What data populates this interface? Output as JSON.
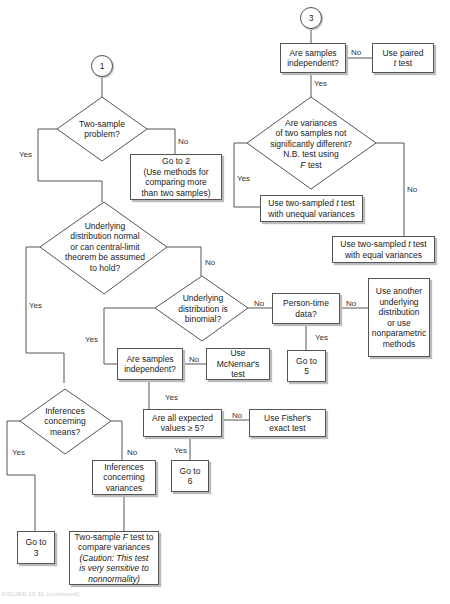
{
  "connectors": {
    "c1": "1",
    "c3": "3"
  },
  "chart1": {
    "two_sample": "Two-sample\nproblem?",
    "goto2": "Go to 2\n(Use methods for\ncomparing more\nthan two samples)",
    "underlying_normal": "Underlying\ndistribution normal\nor can central-limit\ntheorem be assumed\nto hold?",
    "binomial": "Underlying\ndistribution is\nbinomial?",
    "person_time": "Person-time\ndata?",
    "another_dist": "Use another\nunderlying\ndistribution\nor use\nnonparametric\nmethods",
    "goto5": "Go to\n5",
    "samples_indep_b": "Are samples\nindependent?",
    "mcnemar": "Use McNemar's\ntest",
    "expected_values": "Are all expected\nvalues ≥ 5?",
    "fisher": "Use Fisher's\nexact test",
    "goto6": "Go to\n6",
    "inferences_means": "Inferences\nconcerning\nmeans?",
    "inferences_variances": "Inferences\nconcerning\nvariances",
    "goto3": "Go to\n3",
    "f_test_pre": "Two-sample ",
    "f_test_F": "F",
    "f_test_post": " test to\ncompare variances",
    "f_test_caution": "(Caution: This test\nis very sensitive to\nnonnormality)"
  },
  "chart3": {
    "samples_indep": "Are samples\nindependent?",
    "paired_pre": "Use paired",
    "paired_t": "t",
    "paired_post": " test",
    "variances_q_top": "Are variances\nof two samples not\nsignificantly different?\nN.B. test using",
    "variances_q_F": "F",
    "variances_q_post": " test",
    "unequal_pre": "Use two-sampled ",
    "unequal_t": "t",
    "unequal_post": " test\nwith unequal variances",
    "equal_pre": "Use two-sampled ",
    "equal_t": "t",
    "equal_post": " test\nwith equal variances"
  },
  "labels": {
    "yes": "Yes",
    "no": "No"
  },
  "caption": "FIGURE 10.11 (continued)"
}
